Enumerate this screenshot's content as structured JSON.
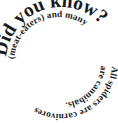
{
  "page": {
    "background_color": "#ffffff",
    "text_color": "#1a1a1a",
    "width": 118,
    "height": 123
  },
  "spiral": {
    "name": "did-you-know-spiral-factoid",
    "heading": "Did you know?",
    "body": "All spiders are carnivores (meat-eaters) and many are cannibals.",
    "full_text": "Did you know? All spiders are carnivores (meat-eaters) and many are cannibals.",
    "direction": "clockwise-inward",
    "heading_font_size_px": 19.5,
    "body_font_size_px": 9.2,
    "font_weight": "bold",
    "font_style": "serif"
  }
}
